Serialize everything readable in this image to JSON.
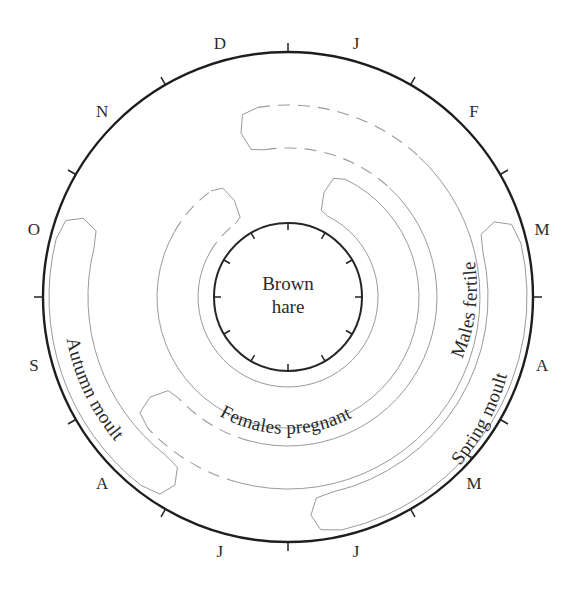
{
  "diagram": {
    "center_label_line1": "Brown",
    "center_label_line2": "hare",
    "months": [
      "J",
      "F",
      "M",
      "A",
      "M",
      "J",
      "J",
      "A",
      "S",
      "O",
      "N",
      "D"
    ],
    "bands": [
      {
        "id": "females-pregnant",
        "label": "Females pregnant",
        "r_inner": 90,
        "r_outer": 131,
        "start_deg": 20,
        "end_deg": 330,
        "dashed_ranges": [
          [
            300,
            326
          ]
        ]
      },
      {
        "id": "males-fertile",
        "label": "Males fertile",
        "r_inner": 149,
        "r_outer": 192,
        "start_deg": 345,
        "end_deg": 593,
        "dashed_ranges": [
          [
            345,
            403
          ],
          [
            555,
            593
          ]
        ]
      },
      {
        "id": "autumn-moult",
        "label": "Autumn moult",
        "r_inner": 200,
        "r_outer": 239,
        "start_deg": 212,
        "end_deg": 290,
        "dashed_ranges": []
      },
      {
        "id": "spring-moult",
        "label": "Spring moult",
        "r_inner": 200,
        "r_outer": 239,
        "start_deg": 71,
        "end_deg": 173,
        "dashed_ranges": []
      }
    ],
    "colors": {
      "ring": "#1e1e1e",
      "band_outline": "#9a9a9a",
      "text": "#2a2a2a"
    }
  }
}
